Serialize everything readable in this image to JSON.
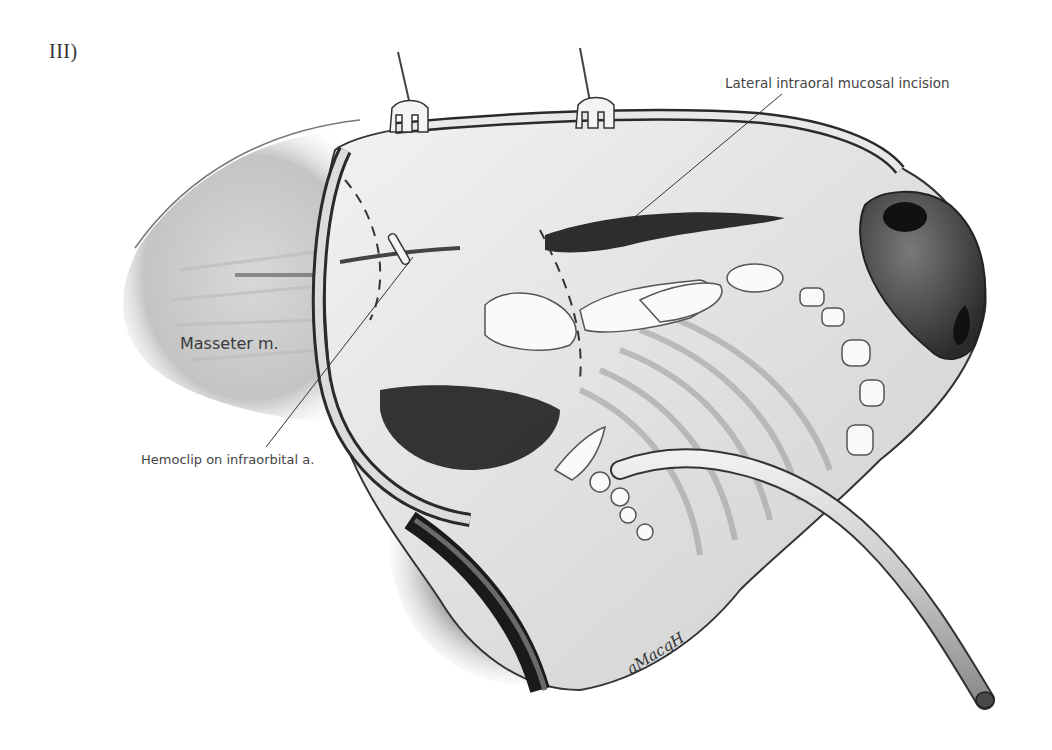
{
  "figure": {
    "panel_label": "III)",
    "labels": {
      "incision": "Lateral intraoral mucosal incision",
      "masseter": "Masseter m.",
      "hemoclip": "Hemoclip on infraorbital a."
    },
    "signature": "aMacgH",
    "style": {
      "background": "#ffffff",
      "ink": "#222222",
      "label_color": "#444444"
    }
  }
}
